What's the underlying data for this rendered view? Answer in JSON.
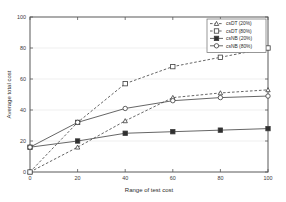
{
  "chart_data": {
    "type": "line",
    "title": "",
    "xlabel": "Range of test cost",
    "ylabel": "Average total cost",
    "xlim": [
      0,
      100
    ],
    "ylim": [
      0,
      100
    ],
    "xticks": [
      0,
      20,
      40,
      60,
      80,
      100
    ],
    "yticks": [
      0,
      20,
      40,
      60,
      80,
      100
    ],
    "xtick_labels": [
      "0",
      "20",
      "40",
      "60",
      "80",
      "100"
    ],
    "ytick_labels": [
      "0",
      "20",
      "40",
      "60",
      "80",
      "100"
    ],
    "grid": true,
    "legend_position": "top-right",
    "x": [
      0,
      20,
      40,
      60,
      80,
      100
    ],
    "series": [
      {
        "name": "csDT (20%)",
        "values": [
          0,
          16,
          33,
          48,
          51,
          53
        ],
        "marker": "triangle",
        "marker_fill": "hollow",
        "linestyle": "dashed",
        "color": "#3c3c3c"
      },
      {
        "name": "csDT (80%)",
        "values": [
          0,
          32,
          57,
          68,
          74,
          80
        ],
        "marker": "square",
        "marker_fill": "hollow",
        "linestyle": "dashed",
        "color": "#3c3c3c"
      },
      {
        "name": "csNB (20%)",
        "values": [
          16,
          20,
          25,
          26,
          27,
          28
        ],
        "marker": "square",
        "marker_fill": "solid",
        "linestyle": "solid",
        "color": "#2f2f2f"
      },
      {
        "name": "csNB (80%)",
        "values": [
          16,
          32,
          41,
          46,
          48,
          49
        ],
        "marker": "circle",
        "marker_fill": "hollow",
        "linestyle": "solid",
        "color": "#3c3c3c"
      }
    ]
  }
}
